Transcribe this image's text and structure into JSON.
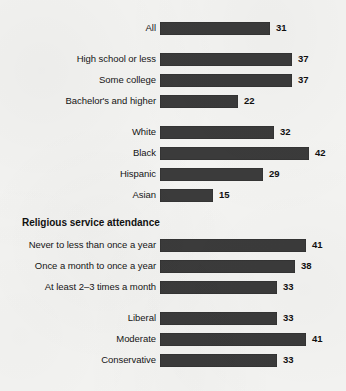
{
  "chart_data": {
    "type": "bar",
    "orientation": "horizontal",
    "title": "",
    "xlabel": "",
    "ylabel": "",
    "xlim": [
      0,
      42
    ],
    "grid": false,
    "legend": false,
    "value_suffix": "",
    "categories": [
      "All",
      "High school or less",
      "Some college",
      "Bachelor's and higher",
      "White",
      "Black",
      "Hispanic",
      "Asian",
      "Never to less than once a year",
      "Once a month to once a year",
      "At least 2–3 times a month",
      "Liberal",
      "Moderate",
      "Conservative"
    ],
    "values": [
      31,
      37,
      37,
      22,
      32,
      42,
      29,
      15,
      41,
      38,
      33,
      33,
      41,
      33
    ],
    "groups": [
      {
        "header": "",
        "rows": [
          {
            "label": "All",
            "value": 31
          }
        ]
      },
      {
        "header": "",
        "rows": [
          {
            "label": "High school or less",
            "value": 37
          },
          {
            "label": "Some college",
            "value": 37
          },
          {
            "label": "Bachelor's and higher",
            "value": 22
          }
        ]
      },
      {
        "header": "",
        "rows": [
          {
            "label": "White",
            "value": 32
          },
          {
            "label": "Black",
            "value": 42
          },
          {
            "label": "Hispanic",
            "value": 29
          },
          {
            "label": "Asian",
            "value": 15
          }
        ]
      },
      {
        "header": "Religious service attendance",
        "rows": [
          {
            "label": "Never to less than once a year",
            "value": 41
          },
          {
            "label": "Once a month to once a year",
            "value": 38
          },
          {
            "label": "At least 2–3 times a month",
            "value": 33
          }
        ]
      },
      {
        "header": "",
        "rows": [
          {
            "label": "Liberal",
            "value": 33
          },
          {
            "label": "Moderate",
            "value": 41
          },
          {
            "label": "Conservative",
            "value": 33
          }
        ]
      }
    ],
    "colors": {
      "bar": "#3b3b3b",
      "background": "#f4f4f2",
      "text": "#151515"
    }
  }
}
